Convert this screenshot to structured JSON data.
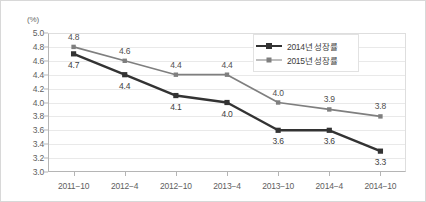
{
  "chart_data": {
    "type": "line",
    "title": "",
    "subtitle": "",
    "xlabel": "",
    "ylabel": "",
    "unit_label": "(%)",
    "categories": [
      "2011−10",
      "2012−4",
      "2012−10",
      "2013−4",
      "2013−10",
      "2014−4",
      "2014−10"
    ],
    "ylim": [
      3.0,
      5.0
    ],
    "ytick_step": 0.2,
    "yticks": [
      "5.0",
      "4.8",
      "4.6",
      "4.4",
      "4.2",
      "4.0",
      "3.8",
      "3.6",
      "3.4",
      "3.2",
      "3.0"
    ],
    "grid": true,
    "legend_position": "top-right-inside",
    "series": [
      {
        "name": "2014년 성장률",
        "color": "#333333",
        "label_position": "below",
        "values": [
          4.7,
          4.4,
          4.1,
          4.0,
          3.6,
          3.6,
          3.3
        ],
        "labels": [
          "4.7",
          "4.4",
          "4.1",
          "4.0",
          "3.6",
          "3.6",
          "3.3"
        ]
      },
      {
        "name": "2015년 성장률",
        "color": "#7f7f7f",
        "label_position": "above",
        "values": [
          4.8,
          4.6,
          4.4,
          4.4,
          4.0,
          3.9,
          3.8
        ],
        "labels": [
          "4.8",
          "4.6",
          "4.4",
          "4.4",
          "4.0",
          "3.9",
          "3.8"
        ]
      }
    ]
  },
  "colors": {
    "series_2014": "#333333",
    "series_2015": "#7f7f7f",
    "grid": "#e9e9e9",
    "axis": "#b5b5b5",
    "frame": "#d8d8d8",
    "text": "#5e5e5e"
  }
}
